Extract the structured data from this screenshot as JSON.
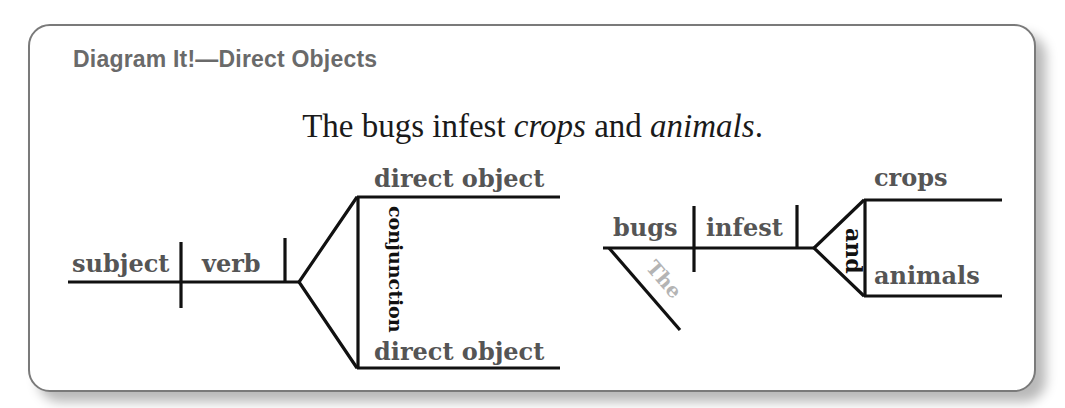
{
  "title": "Diagram It!—Direct Objects",
  "sentence": {
    "parts": [
      {
        "text": "The bugs infest ",
        "italic": false
      },
      {
        "text": "crops",
        "italic": true
      },
      {
        "text": " and ",
        "italic": false
      },
      {
        "text": "animals",
        "italic": true
      },
      {
        "text": ".",
        "italic": false
      }
    ]
  },
  "template_diagram": {
    "subject": "subject",
    "verb": "verb",
    "direct_object_top": "direct object",
    "direct_object_bottom": "direct object",
    "conjunction": "conjunction"
  },
  "example_diagram": {
    "subject": "bugs",
    "modifier": "The",
    "verb": "infest",
    "direct_object_top": "crops",
    "direct_object_bottom": "animals",
    "conjunction": "and"
  },
  "colors": {
    "title": "#6a6a6a",
    "label": "#555555",
    "modifier": "#b4b4b4",
    "line": "#111111",
    "card_border": "#7a7a7a"
  }
}
